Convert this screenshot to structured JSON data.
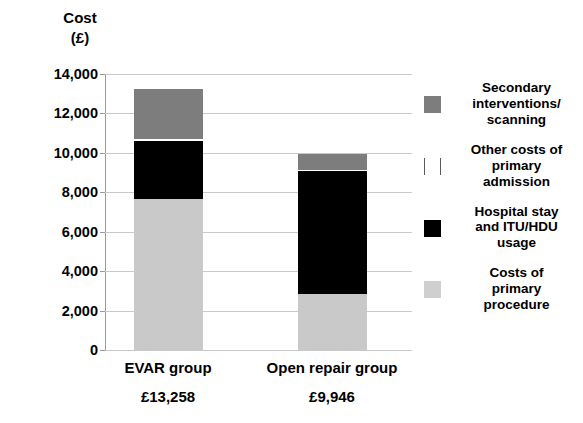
{
  "chart_data": {
    "type": "bar",
    "subtype": "stacked-bar",
    "title": "",
    "xlabel": "",
    "ylabel": "Cost (£)",
    "ylabel_lines": [
      "Cost",
      "(£)"
    ],
    "ylim": [
      0,
      14000
    ],
    "ytick_values": [
      0,
      2000,
      4000,
      6000,
      8000,
      10000,
      12000,
      14000
    ],
    "ytick_labels": [
      "0",
      "2,000",
      "4,000",
      "6,000",
      "8,000",
      "10,000",
      "12,000",
      "14,000"
    ],
    "grid": true,
    "legend_position": "right",
    "categories": [
      "EVAR group",
      "Open repair group"
    ],
    "category_totals": [
      "£13,258",
      "£9,946"
    ],
    "category_total_values": [
      13258,
      9946
    ],
    "series": [
      {
        "name": "Costs of primary procedure",
        "color": "#c9c9c9",
        "values": [
          7650,
          2840
        ]
      },
      {
        "name": "Hospital stay and ITU/HDU usage",
        "color": "#000000",
        "values": [
          2950,
          6240
        ]
      },
      {
        "name": "Other costs of primary admission",
        "color": "#ffffff",
        "values": [
          120,
          70
        ]
      },
      {
        "name": "Secondary interventions/ scanning",
        "color": "#7d7d7d",
        "values": [
          2538,
          796
        ]
      }
    ],
    "legend_entries": [
      {
        "label": "Secondary interventions/ scanning",
        "label_lines": [
          "Secondary",
          "interventions/",
          "scanning"
        ],
        "color": "#7d7d7d",
        "swatch": "filled"
      },
      {
        "label": "Other costs of primary admission",
        "label_lines": [
          "Other costs of",
          "primary",
          "admission"
        ],
        "color": "#ffffff",
        "swatch": "outline"
      },
      {
        "label": "Hospital stay and ITU/HDU usage",
        "label_lines": [
          "Hospital stay",
          "and ITU/HDU",
          "usage"
        ],
        "color": "#000000",
        "swatch": "filled"
      },
      {
        "label": "Costs of primary procedure",
        "label_lines": [
          "Costs of",
          "primary",
          "procedure"
        ],
        "color": "#cfcfcf",
        "swatch": "filled"
      }
    ]
  },
  "colors": {
    "gridline": "#c9c9c9",
    "axis": "#9a9a9a",
    "text": "#000000",
    "background": "#ffffff"
  }
}
